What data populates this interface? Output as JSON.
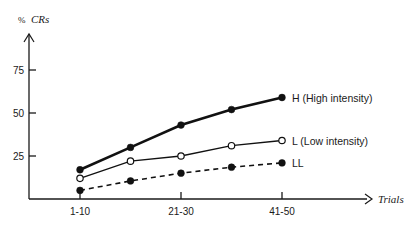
{
  "chart_data": {
    "type": "line",
    "title": "",
    "xlabel": "Trials",
    "ylabel": "% CRs",
    "ylabel_prefix": "%",
    "ylabel_main": "CRs",
    "x": [
      1,
      2,
      3,
      4,
      5
    ],
    "x_tick_labels": [
      {
        "x": 1,
        "label": "1-10"
      },
      {
        "x": 3,
        "label": "21-30"
      },
      {
        "x": 5,
        "label": "41-50"
      }
    ],
    "y_ticks": [
      25,
      50,
      75
    ],
    "y_tick_labels": [
      "25",
      "50",
      "75"
    ],
    "ylim": [
      0,
      90
    ],
    "xlim": [
      0,
      6.7
    ],
    "grid": false,
    "legend": "inline-right",
    "series": [
      {
        "name": "H (High intensity)",
        "values": [
          17,
          30,
          43,
          52,
          59
        ],
        "marker": "filled",
        "line": "solid-thick"
      },
      {
        "name": "L (Low intensity)",
        "values": [
          12,
          22,
          25,
          31,
          34
        ],
        "marker": "open",
        "line": "solid-thin"
      },
      {
        "name": "LL",
        "values": [
          5,
          10.5,
          15,
          18.5,
          21
        ],
        "marker": "filled",
        "line": "dashed"
      }
    ]
  }
}
